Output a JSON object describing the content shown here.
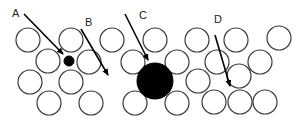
{
  "diagram": {
    "colors": {
      "background": "#ffffff",
      "atom_stroke": "#3a3a3a",
      "defect_fill": "#000000",
      "arrow": "#000000"
    },
    "atom_radius": 12,
    "lattice_atoms": [
      {
        "x": 28,
        "y": 40
      },
      {
        "x": 71,
        "y": 40
      },
      {
        "x": 112,
        "y": 40
      },
      {
        "x": 155,
        "y": 40
      },
      {
        "x": 197,
        "y": 40
      },
      {
        "x": 236,
        "y": 40
      },
      {
        "x": 279,
        "y": 38
      },
      {
        "x": 48,
        "y": 61
      },
      {
        "x": 89,
        "y": 62
      },
      {
        "x": 133,
        "y": 62
      },
      {
        "x": 177,
        "y": 62
      },
      {
        "x": 217,
        "y": 62
      },
      {
        "x": 260,
        "y": 62
      },
      {
        "x": 30,
        "y": 82
      },
      {
        "x": 71,
        "y": 82
      },
      {
        "x": 198,
        "y": 81
      },
      {
        "x": 239,
        "y": 76
      },
      {
        "x": 49,
        "y": 103
      },
      {
        "x": 91,
        "y": 103
      },
      {
        "x": 135,
        "y": 103
      },
      {
        "x": 177,
        "y": 103
      },
      {
        "x": 214,
        "y": 102
      },
      {
        "x": 240,
        "y": 102
      },
      {
        "x": 265,
        "y": 102
      }
    ],
    "defect_atoms": [
      {
        "id": "small-interstitial",
        "x": 69,
        "y": 61,
        "r": 5
      },
      {
        "id": "large-substitutional",
        "x": 155,
        "y": 81,
        "r": 18
      }
    ],
    "arrows": [
      {
        "label": "A",
        "label_x": 12,
        "label_y": 8,
        "x1": 24,
        "y1": 14,
        "x2": 63,
        "y2": 54
      },
      {
        "label": "B",
        "label_x": 85,
        "label_y": 17,
        "x1": 81,
        "y1": 29,
        "x2": 108,
        "y2": 75
      },
      {
        "label": "C",
        "label_x": 139,
        "label_y": 10,
        "x1": 125,
        "y1": 14,
        "x2": 148,
        "y2": 60
      },
      {
        "label": "D",
        "label_x": 214,
        "label_y": 14,
        "x1": 215,
        "y1": 35,
        "x2": 230,
        "y2": 86
      }
    ],
    "labels": {
      "a": "A",
      "b": "B",
      "c": "C",
      "d": "D"
    }
  }
}
